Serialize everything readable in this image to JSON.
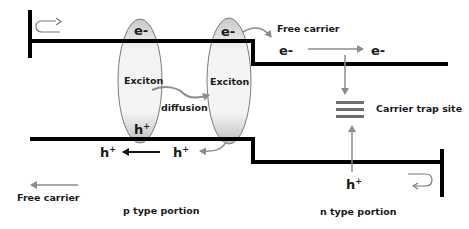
{
  "diagram": {
    "labels": {
      "e_left": "e-",
      "e_right": "e-",
      "exciton_left": "Exciton",
      "exciton_right": "Exciton",
      "diffusion": "diffusion",
      "h_left_ellipse": "h",
      "h_sup": "+",
      "free_carrier_top": "Free carrier",
      "e_free_1": "e-",
      "e_free_2": "e-",
      "carrier_trap_site": "Carrier trap site",
      "h_trap": "h",
      "h_bottom_1": "h",
      "h_bottom_2": "h",
      "free_carrier_bottom": "Free carrier",
      "p_type": "p type portion",
      "n_type": "n type portion"
    },
    "colors": {
      "line": "#000000",
      "arrow_gray": "#8c8c8c",
      "trap_bar": "#6e6e6e",
      "ellipse_fill": "#e6e6e6",
      "ellipse_stroke": "#7a7a7a"
    }
  }
}
